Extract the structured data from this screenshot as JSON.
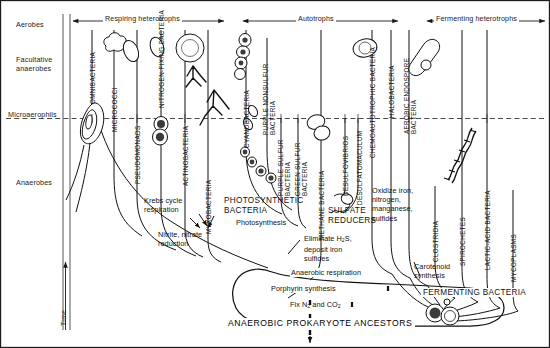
{
  "figure": {
    "bottom_root_label": "ANAEROBIC PROKARYOTE ANCESTORS",
    "time_axis_label": "Time"
  },
  "oxygen_zones": [
    {
      "id": "aerobes",
      "label": "Aerobes"
    },
    {
      "id": "facultative-anaerobes",
      "label": "Facultative\nanaerobes",
      "line1": "Facultative",
      "line2": "anaerobes"
    },
    {
      "id": "microaerophils",
      "label": "Microaerophils"
    },
    {
      "id": "anaerobes",
      "label": "Anaerobes"
    }
  ],
  "header_brackets": [
    {
      "id": "respiring-heterotrophs",
      "label": "Respiring heterotrophs"
    },
    {
      "id": "autotrophs",
      "label": "Autotrophs"
    },
    {
      "id": "fermenting-heterotrophs",
      "label": "Fermenting heterotrophs"
    }
  ],
  "taxa": [
    {
      "id": "omnibacteria",
      "label": "OMNIBACTERIA",
      "lines": [
        "OMNIBACTERIA"
      ]
    },
    {
      "id": "micrococci",
      "label": "MICROCOCCI",
      "lines": [
        "MICROCOCCI"
      ]
    },
    {
      "id": "pseudomonads",
      "label": "PSEUDOMONADS",
      "lines": [
        "PSEUDOMONADS"
      ]
    },
    {
      "id": "nitrogen-fixing-bacteria",
      "label": "NITROGEN-FIXING BACTERIA",
      "lines": [
        "NITROGEN-FIXING BACTERIA"
      ]
    },
    {
      "id": "actinobacteria",
      "label": "ACTINOBACTERIA",
      "lines": [
        "ACTINOBACTERIA"
      ]
    },
    {
      "id": "myxobacteria",
      "label": "MYXOBACTERIA",
      "lines": [
        "MYXOBACTERIA"
      ]
    },
    {
      "id": "cyanobacteria",
      "label": "CYANOBACTERIA",
      "lines": [
        "CYANOBACTERIA"
      ]
    },
    {
      "id": "purple-nonsulfur-bacteria",
      "label": "PURPLE NONSULFUR BACTERIA",
      "lines": [
        "PURPLE NONSULFUR",
        "BACTERIA"
      ]
    },
    {
      "id": "purple-sulfur-bacteria",
      "label": "PURPLE SULFUR BACTERIA",
      "lines": [
        "PURPLE SULFUR",
        "BACTERIA"
      ]
    },
    {
      "id": "green-sulfur-bacteria",
      "label": "GREEN SULFUR BACTERIA",
      "lines": [
        "GREEN SULFUR",
        "BACTERIA"
      ]
    },
    {
      "id": "methane-bacteria",
      "label": "METHANE BACTERIA",
      "lines": [
        "METHANE BACTERIA"
      ]
    },
    {
      "id": "desulfovibrios",
      "label": "DESULFOVIBRIOS",
      "lines": [
        "DESULFOVIBRIOS"
      ]
    },
    {
      "id": "desulfatomaculum",
      "label": "DESULFATOMACULUM",
      "lines": [
        "DESULFATOMACULUM"
      ]
    },
    {
      "id": "chemoautotrophic-bacteria",
      "label": "CHEMOAUTOTROPHIC BACTERIA",
      "lines": [
        "CHEMOAUTOTROPHIC BACTERIA"
      ]
    },
    {
      "id": "halobacteria",
      "label": "HALOBACTERIA",
      "lines": [
        "HALOBACTERIA"
      ]
    },
    {
      "id": "aerobic-endospore-bacteria",
      "label": "AEROBIC ENDOSPORE BACTERIA",
      "lines": [
        "AEROBIC ENDOSPORE",
        "BACTERIA"
      ]
    },
    {
      "id": "clostridia",
      "label": "CLOSTRIDIA",
      "lines": [
        "CLOSTRIDIA"
      ]
    },
    {
      "id": "spirochetes",
      "label": "SPIROCHETES",
      "lines": [
        "SPIROCHETES"
      ]
    },
    {
      "id": "lactic-acid-bacteria",
      "label": "LACTIC-ACID BACTERIA",
      "lines": [
        "LACTIC-ACID BACTERIA"
      ]
    },
    {
      "id": "mycoplasms",
      "label": "MYCOPLASMS",
      "lines": [
        "MYCOPLASMS"
      ]
    }
  ],
  "group_labels": [
    {
      "id": "photosynthetic-bacteria",
      "line1": "PHOTOSYNTHETIC",
      "line2": "BACTERIA"
    },
    {
      "id": "sulfate-reducers",
      "line1": "SULFATE",
      "line2": "REDUCERS"
    },
    {
      "id": "fermenting-bacteria",
      "line1": "FERMENTING BACTERIA",
      "line2": ""
    }
  ],
  "process_annotations": [
    {
      "id": "krebs-cycle-respiration",
      "line1": "Krebs cycle",
      "line2": "respiration"
    },
    {
      "id": "nitrite-nitrate-reduction",
      "line1": "Nitrite, nitrate",
      "line2": "reduction"
    },
    {
      "id": "photosynthesis",
      "line1": "Photosynthesis",
      "line2": ""
    },
    {
      "id": "oxidize-minerals",
      "line1": "Oxidize iron,",
      "line2": "nitrogen,",
      "line3": "manganese,",
      "line4": "sulfides"
    },
    {
      "id": "eliminate-h2s",
      "line1": "Eliminate H",
      "sub1": "2",
      "line1b": "S,",
      "line2": "deposit iron",
      "line3": "sulfides"
    },
    {
      "id": "anaerobic-respiration",
      "line1": "Anaerobic respiration",
      "line2": ""
    },
    {
      "id": "carotenoid-synthesis",
      "line1": "Carotenoid",
      "line2": "synthesis"
    },
    {
      "id": "porphyrin-synthesis",
      "line1": "Porphyrin synthesis",
      "line2": ""
    },
    {
      "id": "fix-n2-co2",
      "pre": "Fix N",
      "sub_a": "2",
      "mid": " and CO",
      "sub_b": "2",
      "post": ""
    }
  ],
  "colors": {
    "ink": "#111111",
    "background": "#ffffff",
    "rule": "#4a4a4a"
  }
}
